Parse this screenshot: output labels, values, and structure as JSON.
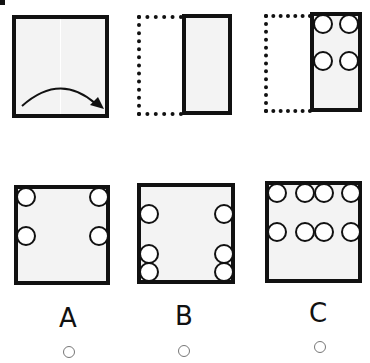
{
  "puzzle": {
    "type": "paper-fold-punch",
    "steps": [
      {
        "id": "step-1",
        "description": "square sheet with vertical fold line and curved arrow folding left half over to the right"
      },
      {
        "id": "step-2",
        "description": "left half folded onto right half (dotted outline shows original left half)"
      },
      {
        "id": "step-3",
        "description": "four holes punched in folded sheet: two at top row, two at middle row"
      }
    ],
    "colors": {
      "stroke": "#111111",
      "paper": "#f3f3f3",
      "hole": "#ffffff"
    }
  },
  "options": [
    {
      "label": "A",
      "holes": 4,
      "layout": "one hole at each top corner and one at each middle side"
    },
    {
      "label": "B",
      "holes": 6,
      "layout": "three holes stacked on left and right edges (middle, lower, bottom)"
    },
    {
      "label": "C",
      "holes": 8,
      "layout": "two rows of four holes across top and middle"
    }
  ],
  "answer_radios": [
    {
      "label": "A",
      "selected": false
    },
    {
      "label": "B",
      "selected": false
    },
    {
      "label": "C",
      "selected": false
    }
  ]
}
